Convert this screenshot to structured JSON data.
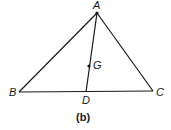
{
  "figure": {
    "caption": "(b)",
    "stroke_color": "#1a1a1a",
    "background": "#ffffff"
  },
  "points": {
    "A": {
      "label": "A",
      "x": 97,
      "y": 13
    },
    "B": {
      "label": "B",
      "x": 19,
      "y": 92
    },
    "C": {
      "label": "C",
      "x": 153,
      "y": 91
    },
    "D": {
      "label": "D",
      "x": 86,
      "y": 92
    },
    "G": {
      "label": "G",
      "x": 89,
      "y": 66
    }
  },
  "segments": [
    {
      "from": "A",
      "to": "B"
    },
    {
      "from": "A",
      "to": "C"
    },
    {
      "from": "B",
      "to": "C"
    },
    {
      "from": "A",
      "to": "D"
    }
  ],
  "marked_points": [
    "A",
    "G"
  ]
}
